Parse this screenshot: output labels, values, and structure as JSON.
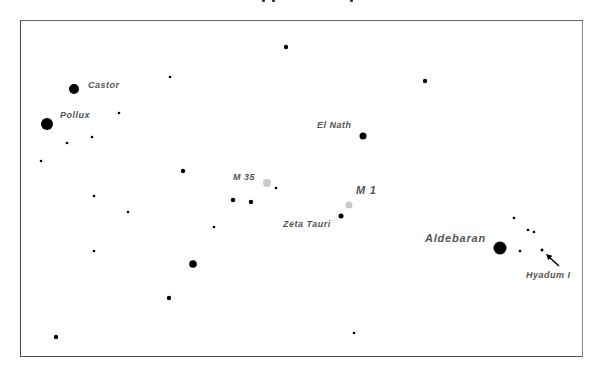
{
  "chart_data": {
    "type": "scatter",
    "title": "",
    "frame": {
      "x": 20,
      "y": 20,
      "width": 563,
      "height": 337
    },
    "labeled_objects": [
      {
        "name": "Castor",
        "x": 74,
        "y": 89,
        "r": 5,
        "kind": "star",
        "label_x": 88,
        "label_y": 88,
        "label_size": 9
      },
      {
        "name": "Pollux",
        "x": 47,
        "y": 124,
        "r": 6,
        "kind": "star",
        "label_x": 60,
        "label_y": 118,
        "label_size": 9
      },
      {
        "name": "El Nath",
        "x": 363,
        "y": 136,
        "r": 3.5,
        "kind": "star",
        "label_x": 317,
        "label_y": 128,
        "label_size": 9
      },
      {
        "name": "M 35",
        "x": 267,
        "y": 183,
        "r": 4,
        "kind": "cluster",
        "label_x": 233,
        "label_y": 180,
        "label_size": 9
      },
      {
        "name": "M 1",
        "x": 349,
        "y": 205,
        "r": 3.5,
        "kind": "nebula",
        "label_x": 356,
        "label_y": 194,
        "label_size": 11
      },
      {
        "name": "Zeta Tauri",
        "x": 341,
        "y": 216,
        "r": 2.5,
        "kind": "star",
        "label_x": 283,
        "label_y": 227,
        "label_size": 9
      },
      {
        "name": "Aldebaran",
        "x": 500,
        "y": 248,
        "r": 6.5,
        "kind": "star",
        "label_x": 425,
        "label_y": 242,
        "label_size": 11
      },
      {
        "name": "Hyadum I",
        "x": 542,
        "y": 250,
        "r": 1.5,
        "kind": "star",
        "label_x": 526,
        "label_y": 278,
        "label_size": 9
      }
    ],
    "stars": [
      {
        "x": 286,
        "y": 47,
        "r": 2.2
      },
      {
        "x": 170,
        "y": 77,
        "r": 1.3
      },
      {
        "x": 425,
        "y": 81,
        "r": 2.2
      },
      {
        "x": 119,
        "y": 113,
        "r": 1.3
      },
      {
        "x": 92,
        "y": 137,
        "r": 1.3
      },
      {
        "x": 67,
        "y": 143,
        "r": 1.3
      },
      {
        "x": 41,
        "y": 161,
        "r": 1.3
      },
      {
        "x": 183,
        "y": 171,
        "r": 2.2
      },
      {
        "x": 276,
        "y": 188,
        "r": 1.3
      },
      {
        "x": 94,
        "y": 196,
        "r": 1.3
      },
      {
        "x": 233,
        "y": 200,
        "r": 2.2
      },
      {
        "x": 251,
        "y": 202,
        "r": 2.2
      },
      {
        "x": 128,
        "y": 212,
        "r": 1.3
      },
      {
        "x": 214,
        "y": 227,
        "r": 1.3
      },
      {
        "x": 94,
        "y": 251,
        "r": 1.3
      },
      {
        "x": 193,
        "y": 264,
        "r": 3.8
      },
      {
        "x": 169,
        "y": 298,
        "r": 2.2
      },
      {
        "x": 354,
        "y": 333,
        "r": 1.3
      },
      {
        "x": 56,
        "y": 337,
        "r": 2.2
      },
      {
        "x": 514,
        "y": 218,
        "r": 1.3
      },
      {
        "x": 528,
        "y": 230,
        "r": 1.3
      },
      {
        "x": 534,
        "y": 232,
        "r": 1.3
      },
      {
        "x": 520,
        "y": 251,
        "r": 1.3
      }
    ],
    "arrow": {
      "from_x": 559,
      "from_y": 266,
      "to_x": 546,
      "to_y": 254,
      "points_to": "Hyadum I"
    },
    "colors": {
      "star": "#000000",
      "deep_sky": "#c8c8c8",
      "label": "#555555",
      "frame": "#555555"
    }
  }
}
